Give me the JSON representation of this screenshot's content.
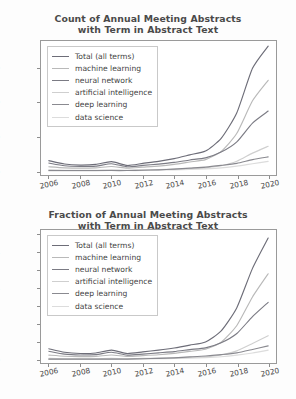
{
  "figure": {
    "background": "#fdfdfd",
    "series_names": [
      "Total (all terms)",
      "machine learning",
      "neural network",
      "artificial intelligence",
      "deep learning",
      "data science"
    ],
    "series_colors": [
      "#6d6d78",
      "#b9b9b9",
      "#7b7b84",
      "#cfcfcf",
      "#8a8a90",
      "#dcdcdc"
    ]
  },
  "chart_data": [
    {
      "type": "line",
      "title": "Count of Annual Meeting Abstracts with Term in Abstract Text",
      "title_line1": "Count of Annual Meeting Abstracts",
      "title_line2": "with Term in Abstract Text",
      "xlabel": "",
      "ylabel": "",
      "grid": false,
      "legend_position": "upper left",
      "x": [
        2006,
        2007,
        2008,
        2009,
        2010,
        2011,
        2012,
        2013,
        2014,
        2015,
        2016,
        2017,
        2018,
        2019,
        2020
      ],
      "xlim": [
        2005.5,
        2020.5
      ],
      "ylim": [
        -12,
        380
      ],
      "xticks": [
        2006,
        2008,
        2010,
        2012,
        2014,
        2016,
        2018,
        2020
      ],
      "xticklabels": [
        "2006",
        "2008",
        "2010",
        "2012",
        "2014",
        "2016",
        "2018",
        "2020"
      ],
      "yticks": [
        0,
        100,
        200,
        300
      ],
      "yticklabels": [
        "0",
        "100",
        "200",
        "300"
      ],
      "series": [
        {
          "name": "Total (all terms)",
          "color": "#6d6d78",
          "values": [
            30,
            20,
            17,
            19,
            27,
            16,
            22,
            28,
            36,
            47,
            58,
            95,
            170,
            300,
            365
          ]
        },
        {
          "name": "machine learning",
          "color": "#b9b9b9",
          "values": [
            12,
            9,
            8,
            9,
            13,
            8,
            11,
            14,
            19,
            26,
            33,
            57,
            110,
            205,
            265
          ]
        },
        {
          "name": "neural network",
          "color": "#7b7b84",
          "values": [
            23,
            15,
            13,
            14,
            21,
            12,
            16,
            20,
            25,
            32,
            38,
            55,
            85,
            140,
            175
          ]
        },
        {
          "name": "artificial intelligence",
          "color": "#cfcfcf",
          "values": [
            3,
            2,
            2,
            2,
            3,
            2,
            3,
            4,
            5,
            7,
            9,
            15,
            28,
            52,
            72
          ]
        },
        {
          "name": "deep learning",
          "color": "#8a8a90",
          "values": [
            1,
            1,
            1,
            1,
            1,
            1,
            2,
            3,
            5,
            8,
            11,
            16,
            22,
            33,
            41
          ]
        },
        {
          "name": "data science",
          "color": "#dcdcdc",
          "values": [
            0,
            0,
            0,
            0,
            1,
            1,
            1,
            2,
            3,
            4,
            6,
            9,
            14,
            21,
            28
          ]
        }
      ]
    },
    {
      "type": "line",
      "title": "Fraction of Annual Meeting Abstracts with Term in Abstract Text",
      "title_line1": "Fraction of Annual Meeting Abstracts",
      "title_line2": "with Term in Abstract Text",
      "xlabel": "",
      "ylabel": "",
      "grid": false,
      "legend_position": "upper left",
      "x": [
        2006,
        2007,
        2008,
        2009,
        2010,
        2011,
        2012,
        2013,
        2014,
        2015,
        2016,
        2017,
        2018,
        2019,
        2020
      ],
      "xlim": [
        2005.5,
        2020.5
      ],
      "ylim": [
        -0.002,
        0.0725
      ],
      "xticks": [
        2006,
        2008,
        2010,
        2012,
        2014,
        2016,
        2018,
        2020
      ],
      "xticklabels": [
        "2006",
        "2008",
        "2010",
        "2012",
        "2014",
        "2016",
        "2018",
        "2020"
      ],
      "yticks": [
        0.0,
        0.01,
        0.02,
        0.03,
        0.04,
        0.05,
        0.06,
        0.07
      ],
      "yticklabels": [
        "0.00",
        "0.01",
        "0.02",
        "0.03",
        "0.04",
        "0.05",
        "0.06",
        "0.07"
      ],
      "series": [
        {
          "name": "Total (all terms)",
          "color": "#6d6d78",
          "values": [
            0.006,
            0.004,
            0.0033,
            0.0036,
            0.0052,
            0.0033,
            0.0042,
            0.0052,
            0.0064,
            0.008,
            0.0098,
            0.016,
            0.029,
            0.051,
            0.068
          ]
        },
        {
          "name": "machine learning",
          "color": "#b9b9b9",
          "values": [
            0.0024,
            0.0018,
            0.0016,
            0.0017,
            0.0025,
            0.0017,
            0.0021,
            0.0026,
            0.0034,
            0.0045,
            0.0057,
            0.0096,
            0.019,
            0.035,
            0.048
          ]
        },
        {
          "name": "neural network",
          "color": "#7b7b84",
          "values": [
            0.0046,
            0.003,
            0.0025,
            0.0027,
            0.004,
            0.0024,
            0.003,
            0.0037,
            0.0044,
            0.0055,
            0.0065,
            0.0093,
            0.0145,
            0.024,
            0.032
          ]
        },
        {
          "name": "artificial intelligence",
          "color": "#cfcfcf",
          "values": [
            0.0006,
            0.0004,
            0.0004,
            0.0004,
            0.0006,
            0.0004,
            0.0006,
            0.0007,
            0.0009,
            0.0012,
            0.0015,
            0.0025,
            0.0048,
            0.0089,
            0.0133
          ]
        },
        {
          "name": "deep learning",
          "color": "#8a8a90",
          "values": [
            0.0002,
            0.0002,
            0.0002,
            0.0002,
            0.0002,
            0.0002,
            0.0004,
            0.0006,
            0.0009,
            0.0014,
            0.0019,
            0.0027,
            0.0037,
            0.0056,
            0.0076
          ]
        },
        {
          "name": "data science",
          "color": "#dcdcdc",
          "values": [
            0.0,
            0.0,
            0.0,
            0.0,
            0.0002,
            0.0002,
            0.0002,
            0.0004,
            0.0005,
            0.0007,
            0.001,
            0.0015,
            0.0024,
            0.0036,
            0.0052
          ]
        }
      ]
    }
  ]
}
